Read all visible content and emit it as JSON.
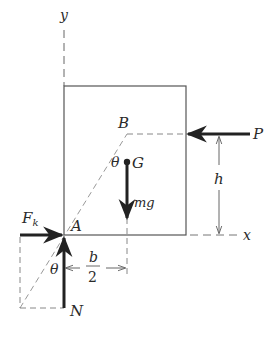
{
  "diagram": {
    "labels": {
      "y_axis": "y",
      "x_axis": "x",
      "point_B": "B",
      "point_G": "G",
      "point_A": "A",
      "angle_upper": "θ",
      "angle_lower": "θ",
      "force_P": "P",
      "weight": "mg",
      "friction": "F",
      "friction_sub": "k",
      "normal": "N",
      "dim_h": "h",
      "dim_b": "b",
      "dim_2": "2"
    },
    "colors": {
      "line": "#555555",
      "arrow": "#222222",
      "dashed": "#888888",
      "text": "#2a2a2a"
    }
  }
}
